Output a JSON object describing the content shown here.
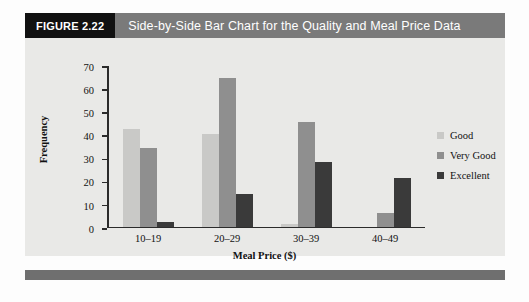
{
  "figure": {
    "tag": "FIGURE 2.22",
    "title": "Side-by-Side Bar Chart for the Quality and Meal Price Data"
  },
  "colors": {
    "good": "#c9c9c7",
    "very_good": "#8f8f8f",
    "excellent": "#3a3a3a",
    "tag_bg": "#111111",
    "title_bg": "#7a7a7a",
    "panel_bg": "#e9e9e7",
    "footer_bar": "#6f6f6f"
  },
  "chart_data": {
    "type": "bar",
    "title": "Side-by-Side Bar Chart for the Quality and Meal Price Data",
    "xlabel": "Meal Price ($)",
    "ylabel": "Frequency",
    "categories": [
      "10–19",
      "20–29",
      "30–39",
      "40–49"
    ],
    "series": [
      {
        "name": "Good",
        "values": [
          42,
          40,
          1,
          0
        ]
      },
      {
        "name": "Very Good",
        "values": [
          34,
          64,
          45,
          6
        ]
      },
      {
        "name": "Excellent",
        "values": [
          2,
          14,
          28,
          21
        ]
      }
    ],
    "ylim": [
      0,
      70
    ],
    "ytick_labels": [
      "70",
      "60",
      "50",
      "40",
      "30",
      "20",
      "10",
      "0"
    ],
    "ytick_values": [
      70,
      60,
      50,
      40,
      30,
      20,
      10,
      0
    ],
    "grid": false,
    "legend_position": "right",
    "legend": [
      "Good",
      "Very Good",
      "Excellent"
    ]
  }
}
